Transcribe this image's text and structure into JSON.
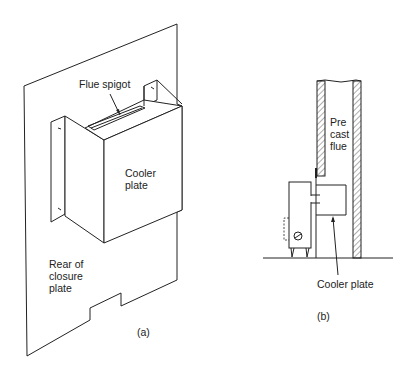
{
  "figure_a": {
    "labels": {
      "flue_spigot": "Flue spigot",
      "cooler_plate_line1": "Cooler",
      "cooler_plate_line2": "plate",
      "rear_line1": "Rear of",
      "rear_line2": "closure",
      "rear_line3": "plate"
    },
    "caption": "(a)"
  },
  "figure_b": {
    "labels": {
      "flue_line1": "Pre",
      "flue_line2": "cast",
      "flue_line3": "flue",
      "cooler_plate": "Cooler plate"
    },
    "caption": "(b)"
  },
  "colors": {
    "line": "#222222",
    "background": "#ffffff"
  }
}
